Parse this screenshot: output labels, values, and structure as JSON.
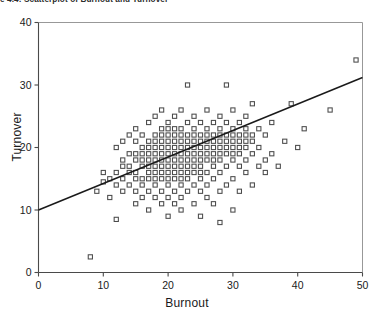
{
  "figure": {
    "title_fragment": "e 4.4:   Scatterplot of Burnout and Turnover"
  },
  "chart_data": {
    "type": "scatter",
    "title": "",
    "xlabel": "Burnout",
    "ylabel": "Turnover",
    "xlim": [
      0,
      50
    ],
    "ylim": [
      0,
      40
    ],
    "xticks": [
      0,
      10,
      20,
      30,
      40,
      50
    ],
    "yticks": [
      0,
      10,
      20,
      30,
      40
    ],
    "grid": false,
    "legend": null,
    "marker": "open-square",
    "marker_color": "#4a4a4a",
    "axis_color": "#4a4a4a",
    "trendline": {
      "type": "linear-regression",
      "color": "#1a1a1a",
      "x_start": 0,
      "y_start": 10.0,
      "x_end": 50,
      "y_end": 31.2,
      "slope": 0.424,
      "intercept": 10.0
    },
    "points": [
      [
        8,
        2.5
      ],
      [
        9,
        13
      ],
      [
        10,
        14.5
      ],
      [
        10,
        16
      ],
      [
        11,
        12
      ],
      [
        11,
        15
      ],
      [
        12,
        8.5
      ],
      [
        12,
        14
      ],
      [
        12,
        16
      ],
      [
        12,
        20
      ],
      [
        13,
        13
      ],
      [
        13,
        15
      ],
      [
        13,
        17
      ],
      [
        13,
        18
      ],
      [
        13,
        21
      ],
      [
        14,
        14
      ],
      [
        14,
        16
      ],
      [
        14,
        17
      ],
      [
        14,
        19
      ],
      [
        14,
        22
      ],
      [
        15,
        11
      ],
      [
        15,
        13
      ],
      [
        15,
        15
      ],
      [
        15,
        16
      ],
      [
        15,
        18
      ],
      [
        15,
        19
      ],
      [
        15,
        21
      ],
      [
        15,
        23
      ],
      [
        16,
        12
      ],
      [
        16,
        14
      ],
      [
        16,
        15
      ],
      [
        16,
        17
      ],
      [
        16,
        18
      ],
      [
        16,
        19
      ],
      [
        16,
        20
      ],
      [
        16,
        22
      ],
      [
        17,
        10
      ],
      [
        17,
        13
      ],
      [
        17,
        15
      ],
      [
        17,
        16
      ],
      [
        17,
        17
      ],
      [
        17,
        18
      ],
      [
        17,
        19
      ],
      [
        17,
        20
      ],
      [
        17,
        21
      ],
      [
        17,
        24
      ],
      [
        18,
        12
      ],
      [
        18,
        14
      ],
      [
        18,
        15
      ],
      [
        18,
        16
      ],
      [
        18,
        17
      ],
      [
        18,
        18
      ],
      [
        18,
        19
      ],
      [
        18,
        20
      ],
      [
        18,
        21
      ],
      [
        18,
        22
      ],
      [
        18,
        25
      ],
      [
        19,
        11
      ],
      [
        19,
        13
      ],
      [
        19,
        15
      ],
      [
        19,
        16
      ],
      [
        19,
        17
      ],
      [
        19,
        18
      ],
      [
        19,
        19
      ],
      [
        19,
        20
      ],
      [
        19,
        21
      ],
      [
        19,
        22
      ],
      [
        19,
        23
      ],
      [
        19,
        26
      ],
      [
        20,
        9
      ],
      [
        20,
        12
      ],
      [
        20,
        14
      ],
      [
        20,
        15
      ],
      [
        20,
        16
      ],
      [
        20,
        17
      ],
      [
        20,
        18
      ],
      [
        20,
        19
      ],
      [
        20,
        20
      ],
      [
        20,
        21
      ],
      [
        20,
        22
      ],
      [
        20,
        23
      ],
      [
        20,
        24
      ],
      [
        21,
        11
      ],
      [
        21,
        13
      ],
      [
        21,
        15
      ],
      [
        21,
        16
      ],
      [
        21,
        17
      ],
      [
        21,
        18
      ],
      [
        21,
        19
      ],
      [
        21,
        20
      ],
      [
        21,
        21
      ],
      [
        21,
        22
      ],
      [
        21,
        23
      ],
      [
        21,
        25
      ],
      [
        22,
        10
      ],
      [
        22,
        12
      ],
      [
        22,
        14
      ],
      [
        22,
        15
      ],
      [
        22,
        16
      ],
      [
        22,
        17
      ],
      [
        22,
        18
      ],
      [
        22,
        19
      ],
      [
        22,
        20
      ],
      [
        22,
        21
      ],
      [
        22,
        22
      ],
      [
        22,
        23
      ],
      [
        22,
        26
      ],
      [
        23,
        13
      ],
      [
        23,
        15
      ],
      [
        23,
        16
      ],
      [
        23,
        17
      ],
      [
        23,
        18
      ],
      [
        23,
        19
      ],
      [
        23,
        20
      ],
      [
        23,
        21
      ],
      [
        23,
        22
      ],
      [
        23,
        24
      ],
      [
        23,
        30
      ],
      [
        24,
        11
      ],
      [
        24,
        14
      ],
      [
        24,
        16
      ],
      [
        24,
        17
      ],
      [
        24,
        18
      ],
      [
        24,
        19
      ],
      [
        24,
        20
      ],
      [
        24,
        21
      ],
      [
        24,
        22
      ],
      [
        24,
        23
      ],
      [
        24,
        25
      ],
      [
        25,
        9
      ],
      [
        25,
        13
      ],
      [
        25,
        15
      ],
      [
        25,
        16
      ],
      [
        25,
        17
      ],
      [
        25,
        18
      ],
      [
        25,
        19
      ],
      [
        25,
        20
      ],
      [
        25,
        21
      ],
      [
        25,
        22
      ],
      [
        25,
        24
      ],
      [
        26,
        12
      ],
      [
        26,
        14
      ],
      [
        26,
        16
      ],
      [
        26,
        18
      ],
      [
        26,
        19
      ],
      [
        26,
        20
      ],
      [
        26,
        21
      ],
      [
        26,
        22
      ],
      [
        26,
        23
      ],
      [
        26,
        26
      ],
      [
        27,
        11
      ],
      [
        27,
        15
      ],
      [
        27,
        17
      ],
      [
        27,
        18
      ],
      [
        27,
        19
      ],
      [
        27,
        20
      ],
      [
        27,
        21
      ],
      [
        27,
        22
      ],
      [
        27,
        24
      ],
      [
        28,
        8
      ],
      [
        28,
        13
      ],
      [
        28,
        16
      ],
      [
        28,
        18
      ],
      [
        28,
        19
      ],
      [
        28,
        20
      ],
      [
        28,
        21
      ],
      [
        28,
        22
      ],
      [
        28,
        23
      ],
      [
        28,
        25
      ],
      [
        29,
        14
      ],
      [
        29,
        17
      ],
      [
        29,
        19
      ],
      [
        29,
        20
      ],
      [
        29,
        21
      ],
      [
        29,
        22
      ],
      [
        29,
        24
      ],
      [
        29,
        30
      ],
      [
        30,
        10
      ],
      [
        30,
        15
      ],
      [
        30,
        18
      ],
      [
        30,
        19
      ],
      [
        30,
        20
      ],
      [
        30,
        21
      ],
      [
        30,
        22
      ],
      [
        30,
        23
      ],
      [
        30,
        26
      ],
      [
        31,
        13
      ],
      [
        31,
        17
      ],
      [
        31,
        19
      ],
      [
        31,
        20
      ],
      [
        31,
        21
      ],
      [
        31,
        22
      ],
      [
        31,
        24
      ],
      [
        32,
        16
      ],
      [
        32,
        18
      ],
      [
        32,
        20
      ],
      [
        32,
        21
      ],
      [
        32,
        22
      ],
      [
        32,
        23
      ],
      [
        32,
        25
      ],
      [
        33,
        14
      ],
      [
        33,
        19
      ],
      [
        33,
        21
      ],
      [
        33,
        22
      ],
      [
        33,
        27
      ],
      [
        34,
        17
      ],
      [
        34,
        20
      ],
      [
        34,
        23
      ],
      [
        35,
        16
      ],
      [
        35,
        18
      ],
      [
        35,
        22
      ],
      [
        36,
        19
      ],
      [
        36,
        24
      ],
      [
        37,
        17
      ],
      [
        38,
        21
      ],
      [
        39,
        27
      ],
      [
        40,
        20
      ],
      [
        41,
        23
      ],
      [
        45,
        26
      ],
      [
        49,
        34
      ]
    ]
  }
}
